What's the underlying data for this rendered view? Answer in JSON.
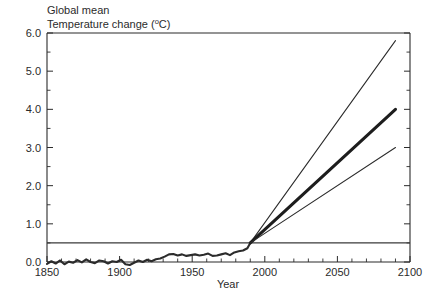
{
  "chart_data": {
    "type": "line",
    "title_line1": "Global mean",
    "title_line2_prefix": "Temperature change (",
    "title_line2_sup": "o",
    "title_line2_suffix": "C)",
    "xlabel": "Year",
    "ylabel": "",
    "xlim": [
      1850,
      2100
    ],
    "ylim": [
      0.0,
      6.0
    ],
    "grid": false,
    "legend": "none",
    "x_ticks": [
      1850,
      1900,
      1950,
      2000,
      2050,
      2100
    ],
    "x_tick_labels": [
      "1850",
      "1900",
      "1950",
      "2000",
      "2050",
      "2100"
    ],
    "x_minor_step": 10,
    "y_ticks": [
      0.0,
      1.0,
      2.0,
      3.0,
      4.0,
      5.0,
      6.0
    ],
    "y_tick_labels": [
      "0.0",
      "1.0",
      "2.0",
      "3.0",
      "4.0",
      "5.0",
      "6.0"
    ],
    "y_minor_step": 0.5,
    "reference_line": {
      "name": "reference-level",
      "y": 0.5,
      "x_start": 1850,
      "x_end": 2100
    },
    "branch_point": {
      "x": 1990,
      "y": 0.5
    },
    "series": [
      {
        "name": "Observed",
        "style": "thick-observed",
        "x": [
          1850,
          1853,
          1856,
          1859,
          1862,
          1865,
          1868,
          1871,
          1874,
          1877,
          1880,
          1883,
          1886,
          1889,
          1892,
          1895,
          1898,
          1901,
          1904,
          1907,
          1910,
          1913,
          1916,
          1919,
          1922,
          1925,
          1928,
          1931,
          1934,
          1937,
          1940,
          1943,
          1946,
          1949,
          1952,
          1955,
          1958,
          1961,
          1964,
          1967,
          1970,
          1973,
          1976,
          1979,
          1982,
          1985,
          1988,
          1990
        ],
        "values": [
          -0.05,
          0.02,
          -0.04,
          0.04,
          -0.06,
          0.01,
          -0.02,
          0.05,
          -0.01,
          0.07,
          0.0,
          -0.03,
          0.04,
          0.02,
          -0.04,
          0.02,
          0.0,
          0.06,
          -0.06,
          -0.08,
          -0.02,
          0.04,
          0.0,
          0.06,
          0.02,
          0.07,
          0.09,
          0.14,
          0.2,
          0.21,
          0.17,
          0.2,
          0.16,
          0.18,
          0.2,
          0.17,
          0.19,
          0.22,
          0.16,
          0.17,
          0.2,
          0.23,
          0.18,
          0.25,
          0.28,
          0.3,
          0.36,
          0.5
        ]
      },
      {
        "name": "High projection",
        "style": "thin",
        "x": [
          1990,
          2090
        ],
        "values": [
          0.5,
          5.8
        ]
      },
      {
        "name": "Best estimate projection",
        "style": "thick",
        "x": [
          1990,
          2090
        ],
        "values": [
          0.5,
          4.0
        ]
      },
      {
        "name": "Low projection",
        "style": "thin",
        "x": [
          1990,
          2090
        ],
        "values": [
          0.5,
          3.0
        ]
      }
    ]
  }
}
